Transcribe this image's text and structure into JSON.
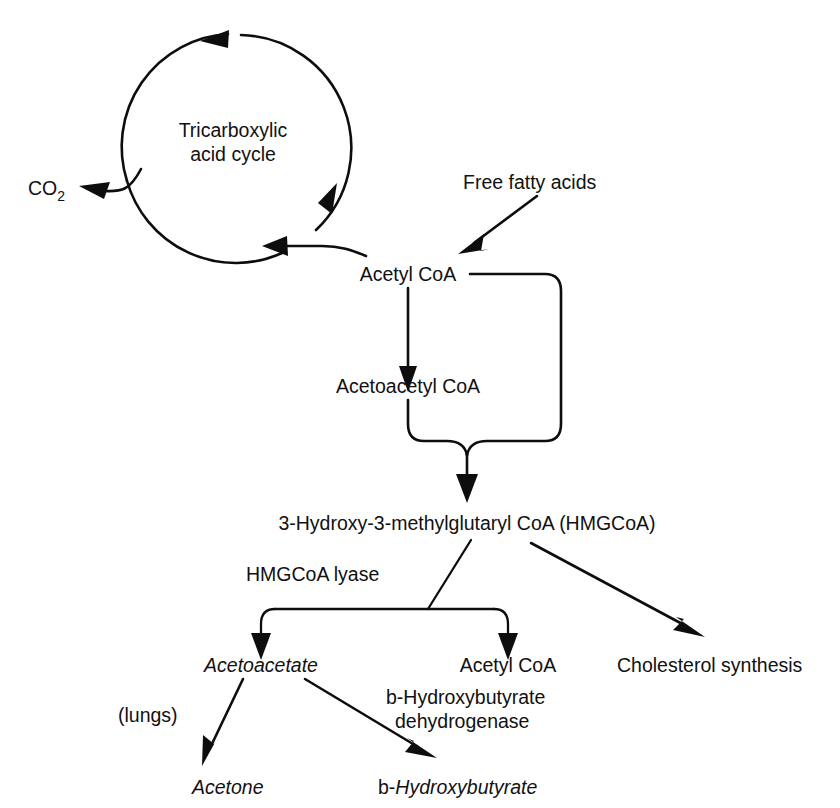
{
  "diagram": {
    "background_color": "#ffffff",
    "ink_color": "#0d0d0d",
    "nodes": {
      "tca_cycle_line1": "Tricarboxylic",
      "tca_cycle_line2": "acid cycle",
      "co2": "CO",
      "co2_subscript": "2",
      "free_fatty_acids": "Free fatty acids",
      "acetyl_coa_top": "Acetyl CoA",
      "acetoacetyl_coa": "Acetoacetyl CoA",
      "hmgcoa": "3-Hydroxy-3-methylglutaryl CoA (HMGCoA)",
      "hmgcoa_lyase": "HMGCoA lyase",
      "acetoacetate": "Acetoacetate",
      "acetyl_coa_bottom": "Acetyl CoA",
      "cholesterol_synthesis": "Cholesterol synthesis",
      "lungs": "(lungs)",
      "bhb_dehydrogenase_line1": "b-Hydroxybutyrate",
      "bhb_dehydrogenase_line2": "dehydrogenase",
      "acetone": "Acetone",
      "bhb_prefix": "b-",
      "bhb_name": "Hydroxybutyrate"
    }
  }
}
